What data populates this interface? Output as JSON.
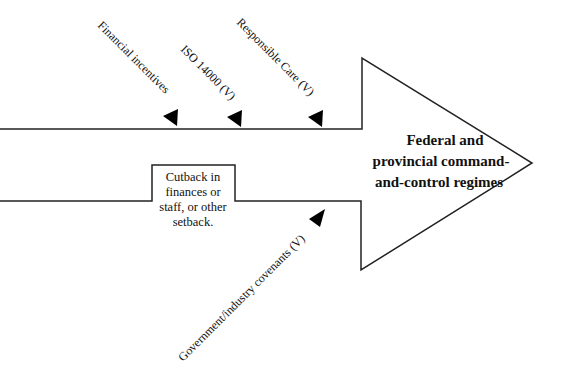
{
  "diagram": {
    "type": "force-field arrow diagram",
    "main_arrow": {
      "label_lines": [
        "Federal and",
        "provincial command-",
        "and-control regimes"
      ]
    },
    "factors_above": [
      {
        "label": "Financial incentives"
      },
      {
        "label": "ISO 14000 (V)"
      },
      {
        "label": "Responsible Care (V)"
      }
    ],
    "factors_below": [
      {
        "label": "Government/industry covenants (V)"
      }
    ],
    "setback_box": {
      "label_lines": [
        "Cutback in",
        "finances or",
        "staff, or other",
        "setback."
      ]
    },
    "colors": {
      "line": "#222222",
      "arrowhead": "#000000",
      "background": "#ffffff"
    }
  }
}
